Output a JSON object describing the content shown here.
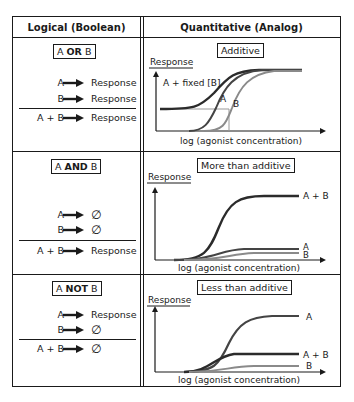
{
  "headers": {
    "left": "Logical (Boolean)",
    "right": "Quantitative (Analog)"
  },
  "rows": [
    {
      "gate": {
        "a": "A",
        "op": "OR",
        "b": "B"
      },
      "lines": [
        {
          "lhs": "A",
          "rhs": "Response"
        },
        {
          "lhs": "B",
          "rhs": "Response"
        },
        {
          "lhs": "A + B",
          "rhs": "Response"
        }
      ],
      "chart_label": "Additive"
    },
    {
      "gate": {
        "a": "A",
        "op": "AND",
        "b": "B"
      },
      "lines": [
        {
          "lhs": "A",
          "rhs": "∅"
        },
        {
          "lhs": "B",
          "rhs": "∅"
        },
        {
          "lhs": "A + B",
          "rhs": "Response"
        }
      ],
      "chart_label": "More than additive"
    },
    {
      "gate": {
        "a": "A",
        "op": "NOT",
        "b": "B"
      },
      "lines": [
        {
          "lhs": "A",
          "rhs": "Response"
        },
        {
          "lhs": "B",
          "rhs": "∅"
        },
        {
          "lhs": "A + B",
          "rhs": "∅"
        }
      ],
      "chart_label": "Less than additive"
    }
  ],
  "axes": {
    "y_label": "Response",
    "x_label": "log (agonist concentration)"
  },
  "curve_labels": {
    "fixed": "A + fixed [B]",
    "a": "A",
    "b": "B",
    "ab": "A + B"
  },
  "colors": {
    "line": "#1a1a1a",
    "curve_ab": "#2b2b2b",
    "curve_a": "#444444",
    "curve_b": "#8a8a8a",
    "guide": "#999999"
  }
}
